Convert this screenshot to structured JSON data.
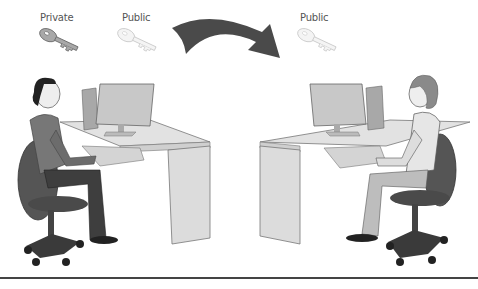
{
  "figure": {
    "left_keys": [
      {
        "label": "Private",
        "type": "private-key",
        "color": "#9a9a9a"
      },
      {
        "label": "Public",
        "type": "public-key",
        "color": "#f0f0f0"
      }
    ],
    "arrow": {
      "direction": "left-to-right",
      "color": "#4a4a4a"
    },
    "right_keys": [
      {
        "label": "Public",
        "type": "public-key",
        "color": "#f0f0f0"
      }
    ],
    "left_person": {
      "description": "man seated at computer desk"
    },
    "right_person": {
      "description": "woman seated at computer desk"
    }
  },
  "colors": {
    "desk": "#d8d8d8",
    "monitor": "#c4c4c4",
    "chair": "#555555",
    "rule": "#444444"
  }
}
